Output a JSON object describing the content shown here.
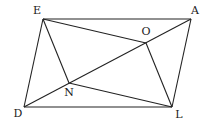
{
  "diagram": {
    "type": "geometry-figure",
    "stroke_color": "#222222",
    "background": "#ffffff",
    "points": {
      "E": {
        "label": "E",
        "x": 43,
        "y": 19,
        "lx": 37,
        "ly": 14
      },
      "A": {
        "label": "A",
        "x": 191,
        "y": 19,
        "lx": 195,
        "ly": 14
      },
      "D": {
        "label": "D",
        "x": 24,
        "y": 107,
        "lx": 18,
        "ly": 117
      },
      "L": {
        "label": "L",
        "x": 172,
        "y": 107,
        "lx": 179,
        "ly": 118
      },
      "O": {
        "label": "O",
        "x": 146,
        "y": 43,
        "lx": 146,
        "ly": 35
      },
      "N": {
        "label": "N",
        "x": 69,
        "y": 83,
        "lx": 69,
        "ly": 96
      }
    },
    "segments": [
      [
        "E",
        "A"
      ],
      [
        "A",
        "L"
      ],
      [
        "L",
        "D"
      ],
      [
        "D",
        "E"
      ],
      [
        "E",
        "O"
      ],
      [
        "D",
        "A"
      ],
      [
        "E",
        "N"
      ],
      [
        "N",
        "L"
      ],
      [
        "O",
        "L"
      ]
    ]
  }
}
